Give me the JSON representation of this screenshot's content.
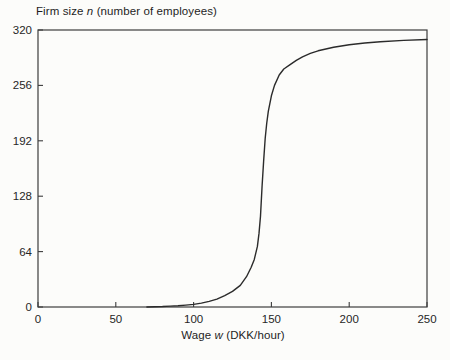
{
  "figure": {
    "title": {
      "prefix": "Firm size ",
      "variable": "n",
      "suffix": " (number of employees)"
    },
    "xlabel": {
      "prefix": "Wage ",
      "variable": "w",
      "suffix": " (DKK/hour)"
    }
  },
  "colors": {
    "background": "#fcfcfa",
    "frame": "#3c3c3c",
    "curve": "#2b2b2b",
    "text": "#262626"
  },
  "chart_data": {
    "type": "line",
    "title": "Firm size n (number of employees)",
    "xlabel": "Wage w (DKK/hour)",
    "ylabel": "Firm size n (number of employees)",
    "xlim": [
      0,
      250
    ],
    "ylim": [
      0,
      320
    ],
    "x_ticks": [
      0,
      50,
      100,
      150,
      200,
      250
    ],
    "y_ticks": [
      0,
      64,
      128,
      192,
      256,
      320
    ],
    "grid": false,
    "legend": null,
    "frame": "box",
    "series": [
      {
        "name": "firm-size-vs-wage",
        "shape": "s-curve (logistic-like)",
        "points": [
          [
            70,
            0
          ],
          [
            75,
            0.3
          ],
          [
            80,
            0.6
          ],
          [
            85,
            1
          ],
          [
            90,
            1.5
          ],
          [
            95,
            2.2
          ],
          [
            100,
            3
          ],
          [
            105,
            4.5
          ],
          [
            110,
            6.5
          ],
          [
            115,
            9
          ],
          [
            120,
            13
          ],
          [
            125,
            18
          ],
          [
            130,
            25
          ],
          [
            134,
            35
          ],
          [
            137,
            46
          ],
          [
            139,
            55
          ],
          [
            141,
            70
          ],
          [
            142,
            85
          ],
          [
            143,
            105
          ],
          [
            144,
            140
          ],
          [
            145,
            168
          ],
          [
            146,
            195
          ],
          [
            147,
            212
          ],
          [
            148,
            226
          ],
          [
            150,
            244
          ],
          [
            152,
            256
          ],
          [
            155,
            268
          ],
          [
            158,
            275
          ],
          [
            162,
            280
          ],
          [
            166,
            285
          ],
          [
            170,
            289
          ],
          [
            175,
            293
          ],
          [
            180,
            296
          ],
          [
            190,
            300
          ],
          [
            200,
            303
          ],
          [
            210,
            305
          ],
          [
            220,
            306.5
          ],
          [
            235,
            308
          ],
          [
            250,
            309
          ]
        ]
      }
    ]
  }
}
